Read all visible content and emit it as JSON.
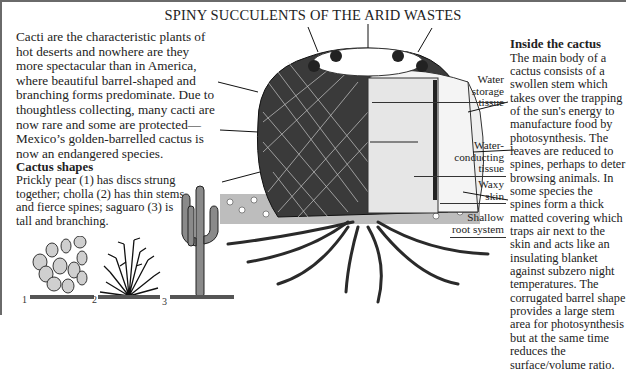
{
  "title": "SPINY SUCCULENTS OF THE ARID WASTES",
  "intro": {
    "text": "Cacti are the characteristic plants of hot deserts and nowhere are they more spectacular than in America, where beautiful barrel-shaped and branching forms predominate. Due to thoughtless collecting, many cacti are now rare and some are protected—Mexico’s golden-barrelled cactus is now an endangered species."
  },
  "cactus_shapes": {
    "heading": "Cactus shapes",
    "text": "Prickly pear (1) has discs strung together; cholla (2) has thin stems and fierce spines; saguaro (3) is tall and branching.",
    "figures": [
      {
        "number": "1",
        "name": "Prickly pear"
      },
      {
        "number": "2",
        "name": "Cholla"
      },
      {
        "number": "3",
        "name": "Saguaro"
      }
    ]
  },
  "inside": {
    "heading": "Inside the cactus",
    "text": "The main body of a cactus consists of a swollen stem which takes over the trapping of the sun's energy to manufacture food by photosynthesis. The leaves are reduced to spines, perhaps to deter browsing animals. In some species the spines form a thick matted covering which traps air next to the skin and acts like an insulating blanket against subzero night temperatures. The corrugated barrel shape provides a large stem area for photosynthesis but at the same time reduces the surface/volume ratio."
  },
  "diagram_labels": [
    {
      "id": "water-storage",
      "lines": [
        "Water",
        "storage",
        "tissue"
      ]
    },
    {
      "id": "water-conducting",
      "lines": [
        "Water-",
        "conducting",
        "tissue"
      ]
    },
    {
      "id": "waxy-skin",
      "lines": [
        "Waxy",
        "skin"
      ]
    },
    {
      "id": "root-system",
      "lines": [
        "Shallow",
        "root system"
      ]
    }
  ],
  "colors": {
    "ink": "#1c1c1c",
    "border": "#6a6a6a",
    "paper": "#ffffff"
  }
}
